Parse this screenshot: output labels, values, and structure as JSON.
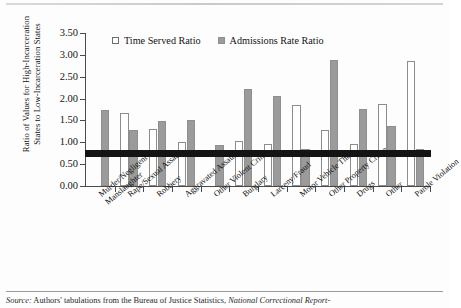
{
  "figure": {
    "y_axis_title_line1": "Ratio of Values for High-Incarceration",
    "y_axis_title_line2": "States to Low-Incarceration States"
  },
  "legend": {
    "items": [
      {
        "label": "Time Served Ratio",
        "swatch": "open-square-icon",
        "color": "#ffffff"
      },
      {
        "label": "Admissions Rate Ratio",
        "swatch": "filled-square-icon",
        "color": "#9b9b9b"
      }
    ]
  },
  "source": {
    "prefix": "Source:",
    "text": " Authors' tabulations from the Bureau of Justice Statistics, ",
    "italic": "National Correctional Report-"
  },
  "chart_data": {
    "type": "bar",
    "title": "",
    "xlabel": "",
    "ylabel": "Ratio of Values for High-Incarceration States to Low-Incarceration States",
    "ylim": [
      0.0,
      3.5
    ],
    "ytick_labels": [
      "0.00",
      "0.50",
      "1.00",
      "1.50",
      "2.00",
      "2.50",
      "3.00",
      "3.50"
    ],
    "ytick_values": [
      0.0,
      0.5,
      1.0,
      1.5,
      2.0,
      2.5,
      3.0,
      3.5
    ],
    "grid": false,
    "legend_position": "top-left-inside",
    "reference_line": {
      "value": 0.75,
      "color": "#141414",
      "thickness_px": 7
    },
    "categories": [
      "Murder/Negligent Manslaughter",
      "Rape/Sexual Assault",
      "Robbery",
      "Aggravated Assault",
      "Other Violent Crime",
      "Burglary",
      "Larceny/Fraud",
      "Motor Vehicle Theft",
      "Other Property Crime",
      "Drugs",
      "Other",
      "Parole Violation"
    ],
    "category_lines": [
      [
        "Murder/Negligent",
        "Manslaughter"
      ],
      [
        "Rape/Sexual Assault",
        ""
      ],
      [
        "Robbery",
        ""
      ],
      [
        "Aggravated Assault",
        ""
      ],
      [
        "Other Violent Crime",
        ""
      ],
      [
        "Burglary",
        ""
      ],
      [
        "Larceny/Fraud",
        ""
      ],
      [
        "Motor Vehicle Theft",
        ""
      ],
      [
        "Other Property Crime",
        ""
      ],
      [
        "Drugs",
        ""
      ],
      [
        "Other",
        ""
      ],
      [
        "Parole Violation",
        ""
      ]
    ],
    "series": [
      {
        "name": "Time Served Ratio",
        "color": "#ffffff",
        "values": [
          0.0,
          1.68,
          1.31,
          1.0,
          0.0,
          1.02,
          0.97,
          1.86,
          1.29,
          0.95,
          1.87,
          2.86
        ]
      },
      {
        "name": "Admissions Rate Ratio",
        "color": "#9b9b9b",
        "values": [
          1.75,
          1.28,
          1.49,
          1.5,
          0.93,
          2.21,
          2.07,
          0.85,
          2.89,
          1.77,
          1.37,
          0.85
        ]
      }
    ]
  }
}
